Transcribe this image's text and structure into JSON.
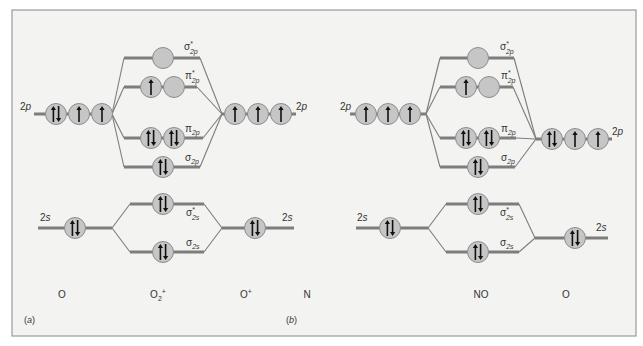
{
  "figure": {
    "frame": {
      "x": 12,
      "y": 10,
      "w": 624,
      "h": 326,
      "bg": "#f3f3f1",
      "border": "#9a9a9a"
    },
    "colors": {
      "orbital_fill": "#c6c6c6",
      "orbital_stroke": "#8c8c8c",
      "level": "#7d7d7d",
      "arrow": "#111111"
    }
  },
  "panels": [
    {
      "id": "a",
      "panel_label": "(a)",
      "panel_label_pos": [
        24,
        323
      ],
      "species": [
        {
          "text": "O",
          "x": 62,
          "y": 298
        },
        {
          "text": "O2+",
          "base": "O",
          "sub": "2",
          "sup": "+",
          "x": 158,
          "y": 298
        },
        {
          "text": "O+",
          "base": "O",
          "sup": "+",
          "x": 246,
          "y": 298
        }
      ],
      "levels": [
        {
          "name": "left-2p",
          "x1": 34,
          "x2": 112,
          "y": 114,
          "orbitals": [
            {
              "x": 56,
              "e": "ud"
            },
            {
              "x": 79,
              "e": "u"
            },
            {
              "x": 102,
              "e": "u"
            }
          ],
          "label": "2p",
          "label_pos": [
            20,
            110
          ],
          "label_anchor": "start"
        },
        {
          "name": "right-2p",
          "x1": 222,
          "x2": 296,
          "y": 114,
          "orbitals": [
            {
              "x": 235,
              "e": "u"
            },
            {
              "x": 258,
              "e": "u"
            },
            {
              "x": 281,
              "e": "u"
            }
          ],
          "label": "2p",
          "label_pos": [
            296,
            110
          ],
          "label_anchor": "start"
        },
        {
          "name": "sigma-star-2p",
          "x1": 124,
          "x2": 200,
          "y": 58,
          "orbitals": [
            {
              "x": 163,
              "e": ""
            }
          ],
          "label": "σ*2p",
          "label_pos": [
            184,
            50
          ]
        },
        {
          "name": "pi-star-2p",
          "x1": 124,
          "x2": 197,
          "y": 87,
          "orbitals": [
            {
              "x": 151,
              "e": "u"
            },
            {
              "x": 174,
              "e": ""
            }
          ],
          "label": "π*2p",
          "label_pos": [
            185,
            79
          ]
        },
        {
          "name": "pi-2p",
          "x1": 124,
          "x2": 203,
          "y": 138,
          "orbitals": [
            {
              "x": 151,
              "e": "ud"
            },
            {
              "x": 174,
              "e": "ud"
            }
          ],
          "label": "π2p",
          "label_pos": [
            185,
            132
          ]
        },
        {
          "name": "sigma-2p",
          "x1": 124,
          "x2": 200,
          "y": 167,
          "orbitals": [
            {
              "x": 163,
              "e": "ud"
            }
          ],
          "label": "σ2p",
          "label_pos": [
            185,
            161
          ]
        },
        {
          "name": "left-2s",
          "x1": 38,
          "x2": 112,
          "y": 228,
          "orbitals": [
            {
              "x": 75,
              "e": "ud"
            }
          ],
          "label": "2s",
          "label_pos": [
            40,
            221
          ],
          "label_anchor": "start"
        },
        {
          "name": "sigma-star-2s",
          "x1": 130,
          "x2": 204,
          "y": 204,
          "orbitals": [
            {
              "x": 163,
              "e": "ud"
            }
          ],
          "label": "σ*2s",
          "label_pos": [
            186,
            216
          ]
        },
        {
          "name": "sigma-2s",
          "x1": 130,
          "x2": 204,
          "y": 252,
          "orbitals": [
            {
              "x": 163,
              "e": "ud"
            }
          ],
          "label": "σ2s",
          "label_pos": [
            186,
            246
          ]
        },
        {
          "name": "right-2s",
          "x1": 222,
          "x2": 294,
          "y": 228,
          "orbitals": [
            {
              "x": 255,
              "e": "ud"
            }
          ],
          "label": "2s",
          "label_pos": [
            282,
            221
          ],
          "label_anchor": "start"
        }
      ],
      "connectors": [
        [
          112,
          114,
          124,
          58
        ],
        [
          112,
          114,
          124,
          87
        ],
        [
          112,
          114,
          124,
          138
        ],
        [
          112,
          114,
          124,
          167
        ],
        [
          222,
          114,
          200,
          58
        ],
        [
          222,
          114,
          197,
          87
        ],
        [
          222,
          114,
          203,
          138
        ],
        [
          222,
          114,
          200,
          167
        ],
        [
          112,
          228,
          130,
          204
        ],
        [
          112,
          228,
          130,
          252
        ],
        [
          222,
          228,
          204,
          204
        ],
        [
          222,
          228,
          204,
          252
        ]
      ]
    },
    {
      "id": "b",
      "panel_label": "(b)",
      "panel_label_pos": [
        286,
        323
      ],
      "species": [
        {
          "text": "N",
          "x": 307,
          "y": 298
        },
        {
          "text": "NO",
          "x": 481,
          "y": 298
        },
        {
          "text": "O",
          "x": 566,
          "y": 298
        }
      ],
      "levels": [
        {
          "name": "left-2p",
          "x1": 350,
          "x2": 426,
          "y": 114,
          "orbitals": [
            {
              "x": 366,
              "e": "u"
            },
            {
              "x": 388,
              "e": "u"
            },
            {
              "x": 410,
              "e": "u"
            }
          ],
          "label": "2p",
          "label_pos": [
            340,
            110
          ],
          "label_anchor": "start"
        },
        {
          "name": "right-2p",
          "x1": 536,
          "x2": 612,
          "y": 139,
          "orbitals": [
            {
              "x": 552,
              "e": "ud"
            },
            {
              "x": 575,
              "e": "u"
            },
            {
              "x": 598,
              "e": "u"
            }
          ],
          "label": "2p",
          "label_pos": [
            612,
            135
          ],
          "label_anchor": "start"
        },
        {
          "name": "sigma-star-2p",
          "x1": 440,
          "x2": 514,
          "y": 58,
          "orbitals": [
            {
              "x": 478,
              "e": ""
            }
          ],
          "label": "σ*2p",
          "label_pos": [
            500,
            50
          ]
        },
        {
          "name": "pi-star-2p",
          "x1": 440,
          "x2": 513,
          "y": 87,
          "orbitals": [
            {
              "x": 466,
              "e": "u"
            },
            {
              "x": 489,
              "e": ""
            }
          ],
          "label": "π*2p",
          "label_pos": [
            501,
            79
          ]
        },
        {
          "name": "pi-2p",
          "x1": 440,
          "x2": 516,
          "y": 138,
          "orbitals": [
            {
              "x": 466,
              "e": "ud"
            },
            {
              "x": 489,
              "e": "ud"
            }
          ],
          "label": "π2p",
          "label_pos": [
            501,
            132
          ]
        },
        {
          "name": "sigma-2p",
          "x1": 440,
          "x2": 515,
          "y": 167,
          "orbitals": [
            {
              "x": 478,
              "e": "ud"
            }
          ],
          "label": "σ2p",
          "label_pos": [
            501,
            161
          ]
        },
        {
          "name": "left-2s",
          "x1": 356,
          "x2": 428,
          "y": 228,
          "orbitals": [
            {
              "x": 390,
              "e": "ud"
            }
          ],
          "label": "2s",
          "label_pos": [
            357,
            221
          ],
          "label_anchor": "start"
        },
        {
          "name": "sigma-star-2s",
          "x1": 446,
          "x2": 519,
          "y": 204,
          "orbitals": [
            {
              "x": 478,
              "e": "ud"
            }
          ],
          "label": "σ*2s",
          "label_pos": [
            500,
            216
          ]
        },
        {
          "name": "sigma-2s",
          "x1": 446,
          "x2": 519,
          "y": 252,
          "orbitals": [
            {
              "x": 478,
              "e": "ud"
            }
          ],
          "label": "σ2s",
          "label_pos": [
            500,
            246
          ]
        },
        {
          "name": "right-2s",
          "x1": 535,
          "x2": 608,
          "y": 238,
          "orbitals": [
            {
              "x": 575,
              "e": "ud"
            }
          ],
          "label": "2s",
          "label_pos": [
            596,
            231
          ],
          "label_anchor": "start"
        }
      ],
      "connectors": [
        [
          426,
          114,
          440,
          58
        ],
        [
          426,
          114,
          440,
          87
        ],
        [
          426,
          114,
          440,
          138
        ],
        [
          426,
          114,
          440,
          167
        ],
        [
          536,
          139,
          514,
          58
        ],
        [
          536,
          139,
          513,
          87
        ],
        [
          536,
          139,
          516,
          138
        ],
        [
          536,
          139,
          515,
          167
        ],
        [
          428,
          228,
          446,
          204
        ],
        [
          428,
          228,
          446,
          252
        ],
        [
          535,
          238,
          519,
          204
        ],
        [
          535,
          238,
          519,
          252
        ]
      ]
    }
  ]
}
